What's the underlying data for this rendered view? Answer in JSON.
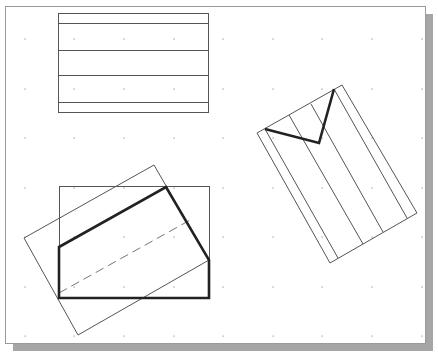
{
  "canvas": {
    "background": "#ffffff",
    "border_color": "#9a9a9a",
    "shadow_color": "#a6a6a6",
    "frame": {
      "x": 5,
      "y": 6,
      "width": 420,
      "height": 337
    },
    "shadow_offset": 8
  },
  "grid": {
    "dot_color": "#9a9a9a",
    "columns_x": [
      25,
      74,
      124,
      174,
      223,
      273,
      322,
      372,
      422
    ],
    "rows_y": [
      39,
      89,
      138,
      188,
      237,
      287,
      336
    ]
  },
  "colors": {
    "thin_line": "#555555",
    "thick_line": "#222222",
    "dashed_line": "#777777"
  },
  "figures": {
    "top_rectangle": {
      "outline": {
        "x": 58,
        "y": 13,
        "width": 150,
        "height": 99
      },
      "horizontal_lines_y": [
        23,
        50,
        75,
        102
      ]
    },
    "bottom_left": {
      "frame_rect": {
        "x": 59,
        "y": 186,
        "width": 150,
        "height": 112
      },
      "rotated_rect": "24,238 154,165 209,260 78,335",
      "thick_polygon": "59,247 166,187 209,260 209,298 59,298",
      "dashed_line": {
        "x1": 59,
        "y1": 293,
        "x2": 192,
        "y2": 219
      }
    },
    "right_figure": {
      "outer_rect": "257,133 342,85 417,213 330,263",
      "interior_lines": [
        {
          "x1": 265,
          "y1": 129,
          "x2": 338,
          "y2": 258
        },
        {
          "x1": 289,
          "y1": 115,
          "x2": 363,
          "y2": 244
        },
        {
          "x1": 311,
          "y1": 104,
          "x2": 383,
          "y2": 232
        },
        {
          "x1": 334,
          "y1": 89,
          "x2": 407,
          "y2": 218
        }
      ],
      "thick_v": "265,129 319,143 334,89"
    }
  }
}
